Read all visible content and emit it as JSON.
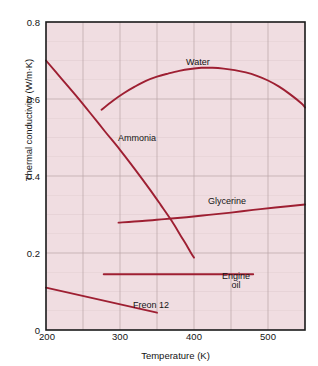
{
  "chart_data": {
    "type": "line",
    "title": "",
    "xlabel": "Temperature (K)",
    "ylabel": "Thermal conductivity (W/m·K)",
    "xlim": [
      200,
      550
    ],
    "ylim": [
      0,
      0.8
    ],
    "xticks": [
      "200",
      "300",
      "400",
      "500"
    ],
    "xtick_values": [
      200,
      300,
      400,
      500
    ],
    "yticks": [
      "0",
      "0.2",
      "0.4",
      "0.6",
      "0.8"
    ],
    "ytick_values": [
      0,
      0.2,
      0.4,
      0.6,
      0.8
    ],
    "grid": true,
    "grid_x_step": 50,
    "grid_y_step": 0.05,
    "legend": "inline-labels",
    "plot_background": "#f0dde1",
    "line_color": "#9e1f32",
    "grid_color": "#b9a3a8",
    "axis_color": "#1a1a1a",
    "series": [
      {
        "name": "Water",
        "label": "Water",
        "x": [
          275,
          290,
          305,
          320,
          335,
          350,
          365,
          380,
          395,
          410,
          425,
          440,
          455,
          470,
          485,
          500,
          515,
          530,
          545,
          550
        ],
        "values": [
          0.572,
          0.595,
          0.615,
          0.632,
          0.647,
          0.658,
          0.666,
          0.673,
          0.678,
          0.681,
          0.681,
          0.679,
          0.675,
          0.669,
          0.66,
          0.648,
          0.632,
          0.612,
          0.589,
          0.578
        ]
      },
      {
        "name": "Ammonia",
        "label": "Ammonia",
        "x": [
          200,
          220,
          240,
          260,
          280,
          300,
          320,
          340,
          355,
          370,
          382,
          390,
          396,
          400
        ],
        "values": [
          0.7,
          0.655,
          0.61,
          0.563,
          0.515,
          0.468,
          0.418,
          0.366,
          0.325,
          0.283,
          0.245,
          0.22,
          0.2,
          0.188
        ]
      },
      {
        "name": "Glycerine",
        "label": "Glycerine",
        "x": [
          298,
          330,
          360,
          390,
          420,
          450,
          480,
          510,
          550
        ],
        "values": [
          0.279,
          0.283,
          0.288,
          0.293,
          0.299,
          0.305,
          0.312,
          0.318,
          0.326
        ]
      },
      {
        "name": "Engine oil",
        "label": "Engine\noil",
        "label_line1": "Engine",
        "label_line2": "oil",
        "x": [
          278,
          480
        ],
        "values": [
          0.145,
          0.145
        ]
      },
      {
        "name": "Freon 12",
        "label": "Freon 12",
        "x": [
          200,
          350
        ],
        "values": [
          0.11,
          0.045
        ]
      }
    ]
  },
  "labels": {
    "water": "Water",
    "ammonia": "Ammonia",
    "glycerine": "Glycerine",
    "engine_oil_line1": "Engine",
    "engine_oil_line2": "oil",
    "freon": "Freon 12"
  },
  "axes": {
    "x_title": "Temperature (K)",
    "y_title": "Thermal conductivity (W/m·K)",
    "x_tick_0": "200",
    "x_tick_1": "300",
    "x_tick_2": "400",
    "x_tick_3": "500",
    "y_tick_0": "0",
    "y_tick_1": "0.2",
    "y_tick_2": "0.4",
    "y_tick_3": "0.6",
    "y_tick_4": "0.8"
  }
}
